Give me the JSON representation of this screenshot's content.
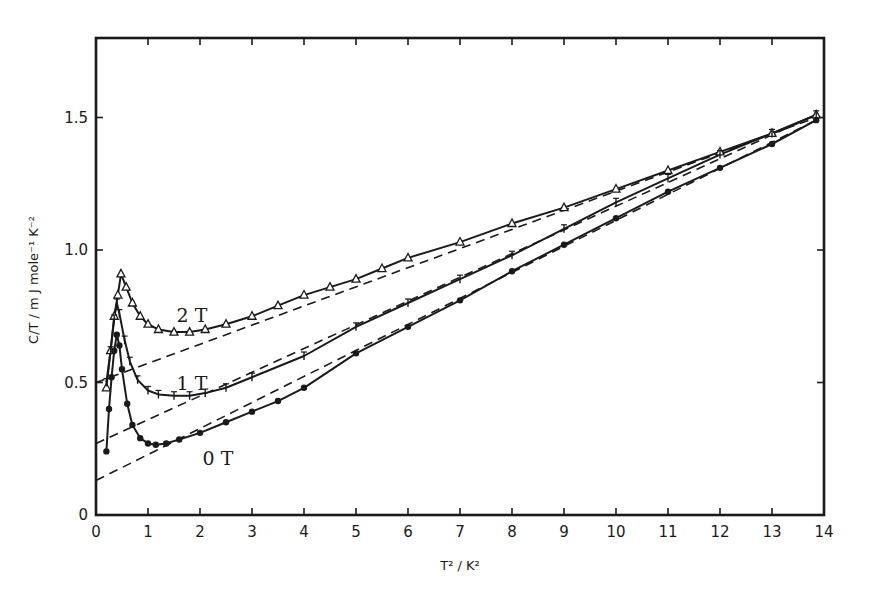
{
  "chart_data": {
    "type": "line",
    "title": "",
    "xlabel": "T² / K²",
    "ylabel": "C/T / m J mole⁻¹ K⁻²",
    "xlim": [
      0,
      14
    ],
    "ylim": [
      0,
      1.8
    ],
    "grid": false,
    "legend": "inline curve labels",
    "xticks": [
      0,
      1,
      2,
      3,
      4,
      5,
      6,
      7,
      8,
      9,
      10,
      11,
      12,
      13,
      14
    ],
    "xtick_labels": [
      "0",
      "1",
      "2",
      "3",
      "4",
      "5",
      "6",
      "7",
      "8",
      "9",
      "10",
      "11",
      "12",
      "13",
      "14"
    ],
    "yticks": [
      0,
      0.5,
      1.0,
      1.5
    ],
    "ytick_labels": [
      "0",
      "0.5",
      "1.0",
      "1.5"
    ],
    "series": [
      {
        "name": "2 T",
        "label": "2 T",
        "marker": "open-triangle",
        "label_pos": [
          1.55,
          0.73
        ],
        "x": [
          0.2,
          0.28,
          0.35,
          0.42,
          0.48,
          0.58,
          0.7,
          0.85,
          1.0,
          1.2,
          1.5,
          1.8,
          2.1,
          2.5,
          3.0,
          3.5,
          4.0,
          4.5,
          5.0,
          5.5,
          6.0,
          7.0,
          8.0,
          9.0,
          10.0,
          11.0,
          12.0,
          13.0,
          13.85
        ],
        "y": [
          0.48,
          0.62,
          0.75,
          0.83,
          0.91,
          0.86,
          0.8,
          0.75,
          0.72,
          0.7,
          0.69,
          0.69,
          0.7,
          0.72,
          0.75,
          0.79,
          0.83,
          0.86,
          0.89,
          0.93,
          0.97,
          1.03,
          1.1,
          1.16,
          1.23,
          1.3,
          1.37,
          1.44,
          1.51
        ]
      },
      {
        "name": "1 T",
        "label": "1 T",
        "marker": "small-cross",
        "label_pos": [
          1.55,
          0.47
        ],
        "x": [
          0.2,
          0.28,
          0.35,
          0.4,
          0.45,
          0.55,
          0.65,
          0.8,
          1.0,
          1.2,
          1.5,
          1.8,
          2.1,
          2.5,
          3.0,
          4.0,
          5.0,
          6.0,
          7.0,
          8.0,
          9.0,
          10.0,
          11.0,
          12.0,
          13.0,
          13.85
        ],
        "y": [
          0.5,
          0.62,
          0.74,
          0.8,
          0.76,
          0.66,
          0.58,
          0.51,
          0.47,
          0.455,
          0.45,
          0.45,
          0.46,
          0.48,
          0.52,
          0.6,
          0.71,
          0.8,
          0.89,
          0.98,
          1.08,
          1.18,
          1.27,
          1.36,
          1.44,
          1.51
        ]
      },
      {
        "name": "0 T",
        "label": "0 T",
        "marker": "filled-circle",
        "label_pos": [
          2.05,
          0.19
        ],
        "x": [
          0.2,
          0.25,
          0.3,
          0.35,
          0.4,
          0.45,
          0.5,
          0.6,
          0.7,
          0.85,
          1.0,
          1.15,
          1.35,
          1.6,
          2.0,
          2.5,
          3.0,
          3.5,
          4.0,
          5.0,
          6.0,
          7.0,
          8.0,
          9.0,
          10.0,
          11.0,
          12.0,
          13.0,
          13.85
        ],
        "y": [
          0.24,
          0.4,
          0.52,
          0.62,
          0.68,
          0.64,
          0.55,
          0.42,
          0.34,
          0.29,
          0.27,
          0.265,
          0.27,
          0.285,
          0.31,
          0.35,
          0.39,
          0.43,
          0.48,
          0.61,
          0.71,
          0.81,
          0.92,
          1.02,
          1.12,
          1.22,
          1.31,
          1.4,
          1.49
        ]
      }
    ],
    "fit_lines": [
      {
        "name": "2 T linear fit",
        "style": "dashed",
        "x": [
          0,
          13.85
        ],
        "y": [
          0.5,
          1.5
        ]
      },
      {
        "name": "1 T linear fit",
        "style": "dashed",
        "x": [
          0,
          13.85
        ],
        "y": [
          0.27,
          1.51
        ]
      },
      {
        "name": "0 T linear fit",
        "style": "dashed",
        "x": [
          0,
          13.85
        ],
        "y": [
          0.13,
          1.49
        ]
      }
    ]
  },
  "labels": {
    "xlabel": "T² / K²",
    "ylabel": "C/T / m J mole⁻¹ K⁻²"
  }
}
